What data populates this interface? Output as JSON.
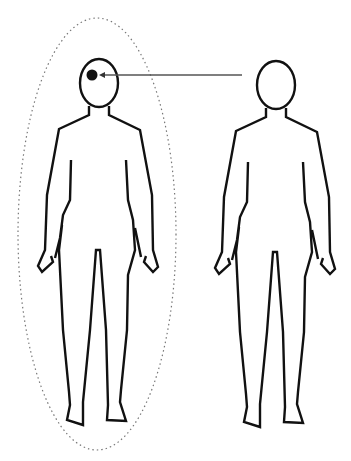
{
  "diagram": {
    "description": "Two human figure outlines; an arrow points from the right figure's head to a black dot in the left figure's head, which is enclosed by a dotted ellipse",
    "figures": [
      {
        "id": "left-figure",
        "head_marker": "black-dot",
        "enclosed": true
      },
      {
        "id": "right-figure",
        "head_marker": "none",
        "enclosed": false
      }
    ],
    "arrow": {
      "from": "right-figure-head",
      "to": "left-figure-head-dot"
    },
    "colors": {
      "stroke": "#111111",
      "arrow": "#555555",
      "ellipse": "#777777",
      "background": "#ffffff"
    }
  }
}
